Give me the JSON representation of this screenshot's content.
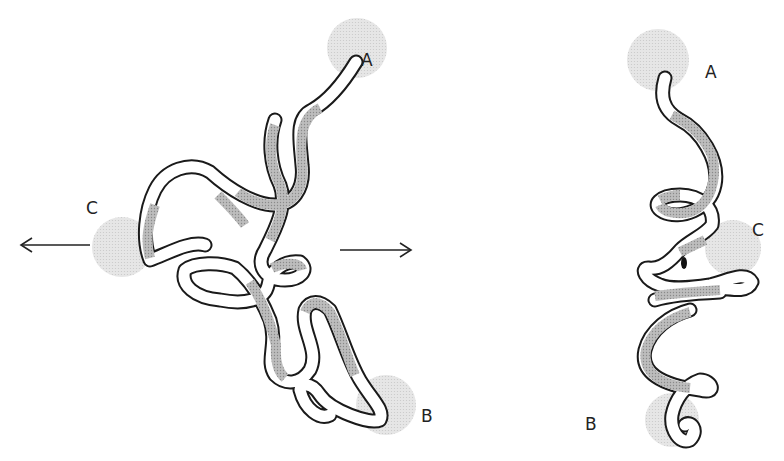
{
  "figure": {
    "left_panel": {
      "labels": {
        "a": "A",
        "b": "B",
        "c": "C"
      },
      "arrows": [
        "left",
        "right"
      ]
    },
    "right_panel": {
      "labels": {
        "a": "A",
        "b": "B",
        "c": "C"
      }
    },
    "colors": {
      "outline": "#1a1a1a",
      "tube_fill": "#ffffff",
      "shaded_segment": "#a8a8a8",
      "site_blob": "#d9d9d9"
    }
  }
}
